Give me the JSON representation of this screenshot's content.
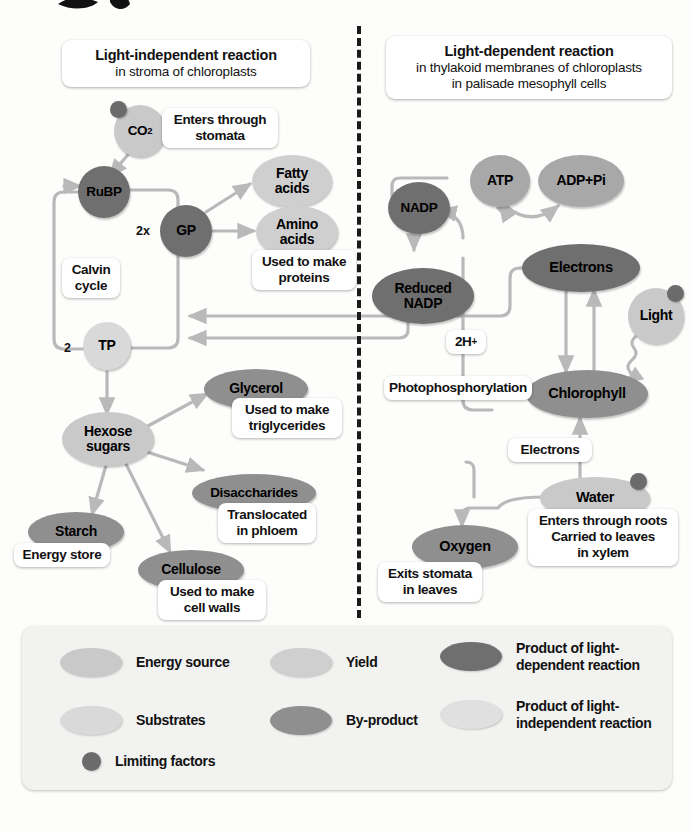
{
  "headers": {
    "left": {
      "title": "Light-independent reaction",
      "sub1": "in stroma of chloroplasts"
    },
    "right": {
      "title": "Light-dependent reaction",
      "sub1": "in thylakoid membranes of chloroplasts",
      "sub2": "in palisade mesophyll cells"
    }
  },
  "left_panel": {
    "co2": "CO",
    "co2_sub": "2",
    "co2_note": "Enters through\nstomata",
    "rubp": "RuBP",
    "gp": "GP",
    "gp_multiplier": "2x",
    "calvin": "Calvin\ncycle",
    "tp": "TP",
    "tp_multiplier": "2",
    "fatty_acids": "Fatty\nacids",
    "amino_acids": "Amino\nacids",
    "amino_note": "Used to make\nproteins",
    "hexose": "Hexose\nsugars",
    "glycerol": "Glycerol",
    "glycerol_note": "Used to make\ntriglycerides",
    "disaccharides": "Disaccharides",
    "disaccharides_note": "Translocated\nin phloem",
    "starch": "Starch",
    "starch_note": "Energy store",
    "cellulose": "Cellulose",
    "cellulose_note": "Used to make\ncell walls"
  },
  "right_panel": {
    "atp": "ATP",
    "adp_pi": "ADP+Pi",
    "nadp": "NADP",
    "reduced_nadp": "Reduced\nNADP",
    "electrons_top": "Electrons",
    "light": "Light",
    "two_h": "2H",
    "two_h_sup": "+",
    "photophosphorylation": "Photophosphorylation",
    "chlorophyll": "Chlorophyll",
    "electrons_label": "Electrons",
    "water": "Water",
    "water_note": "Enters through roots\nCarried to leaves\nin xylem",
    "oxygen": "Oxygen",
    "oxygen_note": "Exits stomata\nin leaves"
  },
  "legend": {
    "items": [
      {
        "label": "Energy source",
        "tone": "#c9c9c9",
        "shape": "ellipse"
      },
      {
        "label": "Yield",
        "tone": "#cfcfcf",
        "shape": "ellipse"
      },
      {
        "label": "Product of light-\ndependent reaction",
        "tone": "#6f6f6f",
        "shape": "ellipse"
      },
      {
        "label": "Substrates",
        "tone": "#d9d9d9",
        "shape": "ellipse"
      },
      {
        "label": "By-product",
        "tone": "#8f8f8f",
        "shape": "ellipse"
      },
      {
        "label": "Product of light-\nindependent reaction",
        "tone": "#e0e0e0",
        "shape": "ellipse"
      },
      {
        "label": "Limiting factors",
        "tone": "#6b6b6b",
        "shape": "dot"
      }
    ]
  },
  "colors": {
    "energy_source": "#c9c9c9",
    "substrates": "#d9d9d9",
    "yield": "#cfcfcf",
    "byproduct": "#8f8f8f",
    "light_dependent_product": "#6f6f6f",
    "light_independent_product": "#e0e0e0",
    "limiting_factor_dot": "#6b6b6b",
    "arrow": "#b9b9b9",
    "divider": "#1a1a1a"
  }
}
